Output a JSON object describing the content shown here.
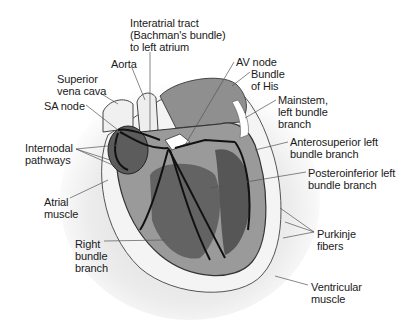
{
  "figure": {
    "labels": [
      {
        "id": "interatrial",
        "text": "Interatrial tract\n(Bachman's bundle)\nto left atrium",
        "x": 130,
        "y": 17
      },
      {
        "id": "aorta",
        "text": "Aorta",
        "x": 111,
        "y": 58
      },
      {
        "id": "av-node",
        "text": "AV node",
        "x": 236,
        "y": 56
      },
      {
        "id": "superior-vena-cava",
        "text": "Superior\nvena cava",
        "x": 57,
        "y": 73
      },
      {
        "id": "bundle-of-his",
        "text": "Bundle\nof His",
        "x": 251,
        "y": 68
      },
      {
        "id": "sa-node",
        "text": "SA node",
        "x": 44,
        "y": 100
      },
      {
        "id": "mainstem-left-bundle",
        "text": "Mainstem,\nleft bundle\nbranch",
        "x": 278,
        "y": 94
      },
      {
        "id": "internodal-pathways",
        "text": "Internodal\npathways",
        "x": 25,
        "y": 142
      },
      {
        "id": "anterosuperior-left-bundle",
        "text": "Anterosuperior left\nbundle branch",
        "x": 290,
        "y": 136
      },
      {
        "id": "posteroinferior-left-bundle",
        "text": "Posteroinferior left\nbundle branch",
        "x": 308,
        "y": 167
      },
      {
        "id": "atrial-muscle",
        "text": "Atrial\nmuscle",
        "x": 44,
        "y": 196
      },
      {
        "id": "purkinje-fibers",
        "text": "Purkinje\nfibers",
        "x": 317,
        "y": 228
      },
      {
        "id": "right-bundle-branch",
        "text": "Right\nbundle\nbranch",
        "x": 75,
        "y": 238
      },
      {
        "id": "ventricular-muscle",
        "text": "Ventricular\nmuscle",
        "x": 311,
        "y": 281
      }
    ]
  }
}
